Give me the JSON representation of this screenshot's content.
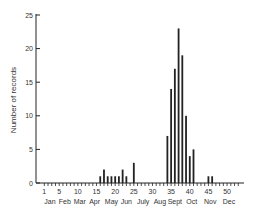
{
  "chart_data": {
    "type": "bar",
    "title": "",
    "xlabel": "",
    "ylabel": "Number of records",
    "ylim": [
      0,
      25
    ],
    "yticks": [
      0,
      5,
      10,
      15,
      20,
      25
    ],
    "xlim": [
      0,
      53
    ],
    "xticks": [
      1,
      5,
      10,
      15,
      20,
      25,
      30,
      35,
      40,
      45,
      50
    ],
    "month_labels": [
      {
        "label": "Jan",
        "x": 2.5
      },
      {
        "label": "Feb",
        "x": 6.5
      },
      {
        "label": "Mar",
        "x": 10.5
      },
      {
        "label": "Apr",
        "x": 14.5
      },
      {
        "label": "May",
        "x": 19
      },
      {
        "label": "Jun",
        "x": 23
      },
      {
        "label": "July",
        "x": 27.5
      },
      {
        "label": "Aug",
        "x": 32
      },
      {
        "label": "Sept",
        "x": 36
      },
      {
        "label": "Oct",
        "x": 40.5
      },
      {
        "label": "Nov",
        "x": 45.5
      },
      {
        "label": "Dec",
        "x": 50.5
      }
    ],
    "grid": false,
    "legend": null,
    "x": [
      16,
      17,
      18,
      19,
      20,
      21,
      22,
      23,
      25,
      34,
      35,
      36,
      37,
      38,
      39,
      40,
      41,
      45,
      46
    ],
    "values": [
      1,
      2,
      1,
      1,
      1,
      1,
      2,
      1,
      3,
      7,
      14,
      17,
      23,
      19,
      10,
      4,
      5,
      1,
      1
    ]
  }
}
